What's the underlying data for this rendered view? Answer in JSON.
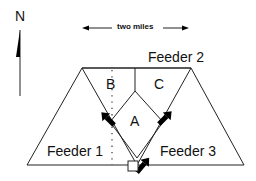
{
  "compass": {
    "label": "N"
  },
  "scale": {
    "label": "two miles"
  },
  "feeders": [
    {
      "id": "feeder-1",
      "label": "Feeder 1"
    },
    {
      "id": "feeder-2",
      "label": "Feeder 2"
    },
    {
      "id": "feeder-3",
      "label": "Feeder 3"
    }
  ],
  "zones": [
    {
      "id": "zone-a",
      "label": "A"
    },
    {
      "id": "zone-b",
      "label": "B"
    },
    {
      "id": "zone-c",
      "label": "C"
    }
  ],
  "colors": {
    "line": "#222222",
    "arrow": "#000000",
    "background": "#ffffff"
  }
}
